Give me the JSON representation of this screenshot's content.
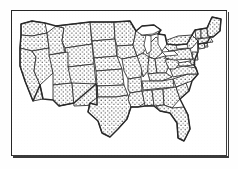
{
  "figure": {
    "style": "stippled line art",
    "frame_label": "map-border-frame"
  },
  "colors": {
    "background": "#ffffff",
    "ink": "#1a1a1a",
    "frame": "#262626",
    "stipple_dot": "#111111",
    "water": "#ffffff"
  },
  "map": {
    "region": "Contiguous United States",
    "projection_note": "simplified planar outline",
    "fill_pattern": "stipple-dots",
    "state_count": 48,
    "states": [
      {
        "code": "WA",
        "name": "Washington",
        "filled": true
      },
      {
        "code": "OR",
        "name": "Oregon",
        "filled": true
      },
      {
        "code": "CA",
        "name": "California",
        "filled": true
      },
      {
        "code": "NV",
        "name": "Nevada",
        "filled": true
      },
      {
        "code": "ID",
        "name": "Idaho",
        "filled": true
      },
      {
        "code": "MT",
        "name": "Montana",
        "filled": true
      },
      {
        "code": "WY",
        "name": "Wyoming",
        "filled": true
      },
      {
        "code": "UT",
        "name": "Utah",
        "filled": true
      },
      {
        "code": "AZ",
        "name": "Arizona",
        "filled": true
      },
      {
        "code": "NM",
        "name": "New Mexico",
        "filled": true
      },
      {
        "code": "CO",
        "name": "Colorado",
        "filled": true
      },
      {
        "code": "ND",
        "name": "North Dakota",
        "filled": true
      },
      {
        "code": "SD",
        "name": "South Dakota",
        "filled": true
      },
      {
        "code": "NE",
        "name": "Nebraska",
        "filled": true
      },
      {
        "code": "KS",
        "name": "Kansas",
        "filled": true
      },
      {
        "code": "OK",
        "name": "Oklahoma",
        "filled": true
      },
      {
        "code": "TX",
        "name": "Texas",
        "filled": true
      },
      {
        "code": "MN",
        "name": "Minnesota",
        "filled": true
      },
      {
        "code": "IA",
        "name": "Iowa",
        "filled": true
      },
      {
        "code": "MO",
        "name": "Missouri",
        "filled": true
      },
      {
        "code": "AR",
        "name": "Arkansas",
        "filled": true
      },
      {
        "code": "LA",
        "name": "Louisiana",
        "filled": true
      },
      {
        "code": "WI",
        "name": "Wisconsin",
        "filled": true
      },
      {
        "code": "IL",
        "name": "Illinois",
        "filled": true
      },
      {
        "code": "MI",
        "name": "Michigan",
        "filled": true
      },
      {
        "code": "IN",
        "name": "Indiana",
        "filled": true
      },
      {
        "code": "OH",
        "name": "Ohio",
        "filled": true
      },
      {
        "code": "KY",
        "name": "Kentucky",
        "filled": true
      },
      {
        "code": "TN",
        "name": "Tennessee",
        "filled": true
      },
      {
        "code": "MS",
        "name": "Mississippi",
        "filled": true
      },
      {
        "code": "AL",
        "name": "Alabama",
        "filled": true
      },
      {
        "code": "GA",
        "name": "Georgia",
        "filled": true
      },
      {
        "code": "FL",
        "name": "Florida",
        "filled": true
      },
      {
        "code": "SC",
        "name": "South Carolina",
        "filled": true
      },
      {
        "code": "NC",
        "name": "North Carolina",
        "filled": true
      },
      {
        "code": "VA",
        "name": "Virginia",
        "filled": true
      },
      {
        "code": "WV",
        "name": "West Virginia",
        "filled": true
      },
      {
        "code": "MD",
        "name": "Maryland",
        "filled": true
      },
      {
        "code": "DE",
        "name": "Delaware",
        "filled": true
      },
      {
        "code": "NJ",
        "name": "New Jersey",
        "filled": true
      },
      {
        "code": "PA",
        "name": "Pennsylvania",
        "filled": true
      },
      {
        "code": "NY",
        "name": "New York",
        "filled": true
      },
      {
        "code": "CT",
        "name": "Connecticut",
        "filled": true
      },
      {
        "code": "RI",
        "name": "Rhode Island",
        "filled": true
      },
      {
        "code": "MA",
        "name": "Massachusetts",
        "filled": true
      },
      {
        "code": "VT",
        "name": "Vermont",
        "filled": true
      },
      {
        "code": "NH",
        "name": "New Hampshire",
        "filled": true
      },
      {
        "code": "ME",
        "name": "Maine",
        "filled": true
      }
    ],
    "water_bodies": [
      {
        "name": "Lake Superior",
        "filled": false
      },
      {
        "name": "Lake Michigan",
        "filled": false
      },
      {
        "name": "Lake Huron",
        "filled": false
      },
      {
        "name": "Lake Erie",
        "filled": false
      },
      {
        "name": "Lake Ontario",
        "filled": false
      }
    ]
  },
  "labels": {
    "visible_text": []
  }
}
